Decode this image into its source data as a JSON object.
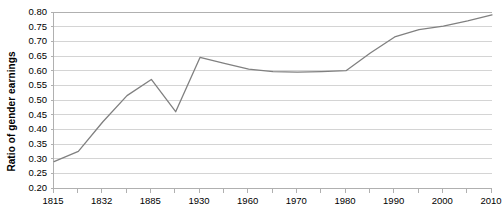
{
  "chart_data": {
    "type": "line",
    "title": "",
    "subtitle": "",
    "xlabel": "",
    "ylabel": "Ratio of gender earnings",
    "ylim": [
      0.2,
      0.8
    ],
    "ytick_step": 0.05,
    "ytick_labels": [
      "0.80",
      "0.75",
      "0.70",
      "0.65",
      "0.60",
      "0.55",
      "0.50",
      "0.45",
      "0.40",
      "0.35",
      "0.30",
      "0.25",
      "0.20"
    ],
    "ytick_values": [
      0.8,
      0.75,
      0.7,
      0.65,
      0.6,
      0.55,
      0.5,
      0.45,
      0.4,
      0.35,
      0.3,
      0.25,
      0.2
    ],
    "grid": true,
    "grid_axis": "y",
    "legend": "none",
    "legend_position": "none",
    "x_axis_type": "category",
    "xtick_labels": [
      "1815",
      "1832",
      "1885",
      "1930",
      "1960",
      "1970",
      "1980",
      "1990",
      "2000",
      "2010"
    ],
    "xtick_label_indices": [
      0,
      2,
      4,
      6,
      8,
      10,
      12,
      14,
      16,
      18
    ],
    "categories": [
      "1815",
      "",
      "1832",
      "",
      "1885",
      "",
      "1930",
      "",
      "1960",
      "",
      "1970",
      "",
      "1980",
      "",
      "1990",
      "",
      "2000",
      "",
      "2010"
    ],
    "x": [
      1815,
      1820,
      1832,
      1855,
      1885,
      1905,
      1930,
      1945,
      1960,
      1965,
      1970,
      1975,
      1980,
      1985,
      1990,
      1995,
      2000,
      2005,
      2010
    ],
    "values": [
      0.29,
      0.325,
      0.425,
      0.515,
      0.57,
      0.46,
      0.645,
      0.625,
      0.605,
      0.597,
      0.595,
      0.597,
      0.6,
      0.66,
      0.715,
      0.74,
      0.752,
      0.77,
      0.79
    ],
    "series": [
      {
        "name": "Ratio of gender earnings",
        "color": "#808080",
        "values": [
          0.29,
          0.325,
          0.425,
          0.515,
          0.57,
          0.46,
          0.645,
          0.625,
          0.605,
          0.597,
          0.595,
          0.597,
          0.6,
          0.66,
          0.715,
          0.74,
          0.752,
          0.77,
          0.79
        ]
      }
    ],
    "annotations": []
  },
  "style": {
    "line_color": "#808080",
    "grid_color": "#d4d4d4",
    "axis_color": "#b0b0b0",
    "text_color": "#000000",
    "background": "#ffffff"
  }
}
